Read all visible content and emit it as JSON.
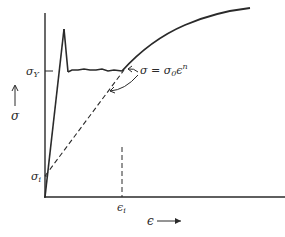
{
  "diagram": {
    "colors": {
      "ink": "#2a2a2a",
      "background": "#ffffff"
    },
    "labels": {
      "sigma_y": {
        "main": "σ",
        "sub": "Y"
      },
      "sigma_axis": "σ",
      "sigma_i": {
        "main": "σ",
        "sub": "i"
      },
      "epsilon_i": {
        "main": "ϵ",
        "sub": "i"
      },
      "epsilon_axis": "ϵ",
      "equation": {
        "lhs": "σ = σ",
        "sub": "0",
        "base": "ϵ",
        "exp": "n"
      }
    },
    "curves": [
      {
        "name": "elastic-loading",
        "style": "solid"
      },
      {
        "name": "upper-yield-drop",
        "style": "solid"
      },
      {
        "name": "luders-plateau",
        "style": "solid"
      },
      {
        "name": "strain-hardening-curve",
        "style": "solid"
      },
      {
        "name": "power-law-extrapolation",
        "style": "dashed"
      },
      {
        "name": "epsilon-i-marker",
        "style": "dashed"
      }
    ]
  }
}
